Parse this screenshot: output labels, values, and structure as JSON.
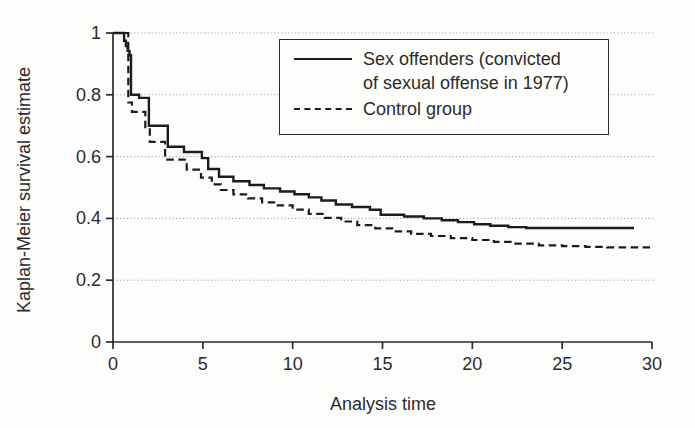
{
  "chart_data": {
    "type": "line",
    "subtype": "kaplan-meier-step",
    "title": "",
    "xlabel": "Analysis time",
    "ylabel": "Kaplan-Meier survival estimate",
    "xlim": [
      0,
      30
    ],
    "ylim": [
      0,
      1
    ],
    "x_ticks": [
      0,
      5,
      10,
      15,
      20,
      25,
      30
    ],
    "x_tick_labels": [
      "0",
      "5",
      "10",
      "15",
      "20",
      "25",
      "30"
    ],
    "y_ticks": [
      0,
      0.2,
      0.4,
      0.6,
      0.8,
      1
    ],
    "y_tick_labels": [
      "0",
      "0.2",
      "0.4",
      "0.6",
      "0.8",
      "1"
    ],
    "grid": "horizontal-dotted",
    "legend": {
      "position": "top-right",
      "border": true,
      "entries": [
        {
          "label": "Sex offenders (convicted of sexual offense in 1977)",
          "label_lines": [
            "Sex offenders (convicted",
            "of sexual offense in 1977)"
          ],
          "line_style": "solid"
        },
        {
          "label": "Control group",
          "label_lines": [
            "Control group",
            ""
          ],
          "line_style": "dashed"
        }
      ]
    },
    "series": [
      {
        "name": "Sex offenders (convicted of sexual offense in 1977)",
        "style": "solid",
        "color": "#1c1c1c",
        "points": [
          [
            0,
            1.0
          ],
          [
            0.55,
            1.0
          ],
          [
            0.62,
            0.975
          ],
          [
            0.72,
            0.958
          ],
          [
            0.82,
            0.942
          ],
          [
            0.92,
            0.928
          ],
          [
            1.0,
            0.8
          ],
          [
            1.45,
            0.79
          ],
          [
            2.0,
            0.7
          ],
          [
            3.05,
            0.632
          ],
          [
            3.95,
            0.615
          ],
          [
            4.95,
            0.595
          ],
          [
            5.3,
            0.56
          ],
          [
            5.9,
            0.535
          ],
          [
            6.7,
            0.52
          ],
          [
            7.6,
            0.508
          ],
          [
            8.4,
            0.497
          ],
          [
            9.3,
            0.487
          ],
          [
            10.1,
            0.478
          ],
          [
            10.9,
            0.468
          ],
          [
            11.6,
            0.458
          ],
          [
            12.4,
            0.445
          ],
          [
            13.3,
            0.437
          ],
          [
            14.3,
            0.428
          ],
          [
            14.9,
            0.412
          ],
          [
            16.2,
            0.406
          ],
          [
            17.3,
            0.4
          ],
          [
            18.3,
            0.394
          ],
          [
            19.2,
            0.388
          ],
          [
            20.1,
            0.381
          ],
          [
            21.0,
            0.376
          ],
          [
            22.0,
            0.372
          ],
          [
            23.0,
            0.369
          ],
          [
            29.0,
            0.369
          ]
        ]
      },
      {
        "name": "Control group",
        "style": "dashed",
        "color": "#1c1c1c",
        "points": [
          [
            0,
            1.0
          ],
          [
            0.8,
            1.0
          ],
          [
            0.85,
            0.775
          ],
          [
            1.05,
            0.745
          ],
          [
            1.8,
            0.695
          ],
          [
            2.05,
            0.648
          ],
          [
            2.9,
            0.59
          ],
          [
            4.1,
            0.558
          ],
          [
            4.9,
            0.532
          ],
          [
            5.5,
            0.51
          ],
          [
            6.0,
            0.492
          ],
          [
            6.7,
            0.478
          ],
          [
            7.5,
            0.465
          ],
          [
            8.3,
            0.452
          ],
          [
            9.1,
            0.442
          ],
          [
            10.0,
            0.428
          ],
          [
            10.9,
            0.415
          ],
          [
            11.8,
            0.402
          ],
          [
            12.7,
            0.39
          ],
          [
            13.6,
            0.378
          ],
          [
            14.6,
            0.368
          ],
          [
            15.6,
            0.358
          ],
          [
            16.6,
            0.35
          ],
          [
            17.7,
            0.343
          ],
          [
            18.8,
            0.336
          ],
          [
            20.0,
            0.33
          ],
          [
            21.2,
            0.324
          ],
          [
            22.4,
            0.318
          ],
          [
            23.7,
            0.313
          ],
          [
            25.0,
            0.31
          ],
          [
            26.3,
            0.308
          ],
          [
            27.5,
            0.306
          ],
          [
            30.0,
            0.306
          ]
        ]
      }
    ]
  },
  "colors": {
    "background": "#fdfdfc",
    "axis": "#2b2b2b",
    "grid": "#b2b0ad",
    "text": "#2b2b2b",
    "line": "#1c1c1c"
  }
}
